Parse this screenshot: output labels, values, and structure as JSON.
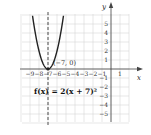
{
  "chart_data": {
    "type": "line",
    "title": "",
    "function_label": "f(x) = 2(x + 7)²",
    "xlabel": "x",
    "ylabel": "y",
    "xlim": [
      -10,
      2
    ],
    "ylim": [
      -6,
      6
    ],
    "grid": true,
    "x_ticks": [
      -9,
      -8,
      -7,
      -6,
      -5,
      -4,
      -3,
      -2,
      -1,
      1
    ],
    "y_ticks": [
      -5,
      -4,
      -3,
      -2,
      -1,
      1,
      2,
      3,
      4,
      5
    ],
    "vertex": {
      "x": -7,
      "y": 0,
      "label": "(−7, 0)"
    },
    "axis_of_symmetry": {
      "x": -7,
      "style": "dashed"
    },
    "series": [
      {
        "name": "f(x) = 2(x + 7)²",
        "x": [
          -8.7,
          -8.5,
          -8,
          -7.5,
          -7,
          -6.5,
          -6,
          -5.5,
          -5.3
        ],
        "y": [
          5.78,
          4.5,
          2,
          0.5,
          0,
          0.5,
          2,
          4.5,
          5.78
        ]
      }
    ]
  },
  "labels": {
    "x_axis": "x",
    "y_axis": "y",
    "vertex_label": "(−7, 0)",
    "equation": "f(x) = 2(x + 7)²"
  }
}
